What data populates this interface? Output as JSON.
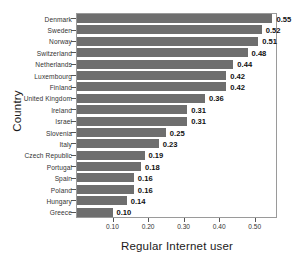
{
  "chart_data": {
    "type": "bar",
    "orientation": "horizontal",
    "title": "",
    "xlabel": "Regular Internet user",
    "ylabel": "Country",
    "xlim": [
      0.0,
      0.56
    ],
    "xticks": [
      0.1,
      0.2,
      0.3,
      0.4,
      0.5
    ],
    "xtick_labels": [
      "0.10",
      "0.20",
      "0.30",
      "0.40",
      "0.50"
    ],
    "grid": false,
    "legend": null,
    "bar_color": "#6e6e6e",
    "categories": [
      "Denmark",
      "Sweden",
      "Norway",
      "Switzerland",
      "Netherlands",
      "Luxembourg",
      "Finland",
      "United Kingdom",
      "Ireland",
      "Israel",
      "Slovenia",
      "Italy",
      "Czech Republic",
      "Portugal",
      "Spain",
      "Poland",
      "Hungary",
      "Greece"
    ],
    "values": [
      0.55,
      0.52,
      0.51,
      0.48,
      0.44,
      0.42,
      0.42,
      0.36,
      0.31,
      0.31,
      0.25,
      0.23,
      0.19,
      0.18,
      0.16,
      0.16,
      0.14,
      0.1
    ],
    "value_labels": [
      "0.55",
      "0.52",
      "0.51",
      "0.48",
      "0.44",
      "0.42",
      "0.42",
      "0.36",
      "0.31",
      "0.31",
      "0.25",
      "0.23",
      "0.19",
      "0.18",
      "0.16",
      "0.16",
      "0.14",
      "0.10"
    ]
  }
}
